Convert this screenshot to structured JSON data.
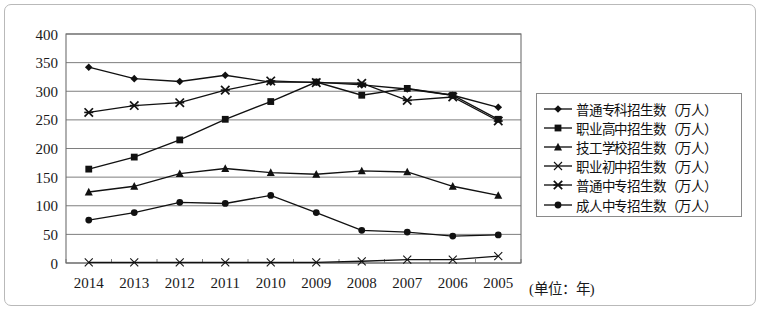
{
  "chart_data": {
    "type": "line",
    "title": "",
    "subtitle": "",
    "xlabel": "(单位：年)",
    "ylabel": "",
    "x": [
      "2014",
      "2013",
      "2012",
      "2011",
      "2010",
      "2009",
      "2008",
      "2007",
      "2006",
      "2005"
    ],
    "categories": [
      "2014",
      "2013",
      "2012",
      "2011",
      "2010",
      "2009",
      "2008",
      "2007",
      "2006",
      "2005"
    ],
    "ylim": [
      0,
      400
    ],
    "yticks": [
      0,
      50,
      100,
      150,
      200,
      250,
      300,
      350,
      400
    ],
    "ytick_labels": [
      "0",
      "50",
      "100",
      "150",
      "200",
      "250",
      "300",
      "350",
      "400"
    ],
    "grid": "horizontal",
    "legend_position": "right",
    "x_direction": "descending-years",
    "series": [
      {
        "name": "普通专科招生数（万人）",
        "marker": "diamond",
        "values": [
          342,
          322,
          317,
          328,
          316,
          316,
          311,
          304,
          293,
          272
        ]
      },
      {
        "name": "职业高中招生数（万人）",
        "marker": "square",
        "values": [
          164,
          185,
          215,
          251,
          282,
          316,
          293,
          305,
          293,
          251
        ]
      },
      {
        "name": "技工学校招生数（万人）",
        "marker": "triangle",
        "values": [
          124,
          134,
          156,
          165,
          158,
          155,
          161,
          159,
          134,
          118
        ]
      },
      {
        "name": "职业初中招生数（万人）",
        "marker": "x-thin",
        "values": [
          1,
          1,
          1,
          1,
          1,
          1,
          3,
          6,
          6,
          12
        ]
      },
      {
        "name": "普通中专招生数（万人）",
        "marker": "asterisk",
        "values": [
          263,
          275,
          280,
          302,
          318,
          315,
          314,
          284,
          290,
          248
        ]
      },
      {
        "name": "成人中专招生数（万人）",
        "marker": "circle",
        "values": [
          75,
          88,
          106,
          104,
          118,
          88,
          57,
          54,
          47,
          49
        ]
      }
    ]
  },
  "legend": {
    "items": [
      {
        "label": "普通专科招生数（万人）",
        "marker": "diamond"
      },
      {
        "label": "职业高中招生数（万人）",
        "marker": "square"
      },
      {
        "label": "技工学校招生数（万人）",
        "marker": "triangle"
      },
      {
        "label": "职业初中招生数（万人）",
        "marker": "x-thin"
      },
      {
        "label": "普通中专招生数（万人）",
        "marker": "asterisk"
      },
      {
        "label": "成人中专招生数（万人）",
        "marker": "circle"
      }
    ]
  },
  "axis": {
    "unit_caption": "(单位：年)"
  },
  "colors": {
    "line": "#111111",
    "grid": "#6f6f6f",
    "frame": "#b9b9b9",
    "legend_border": "#8a8a8a",
    "background": "#ffffff",
    "text": "#1a1a1a"
  }
}
